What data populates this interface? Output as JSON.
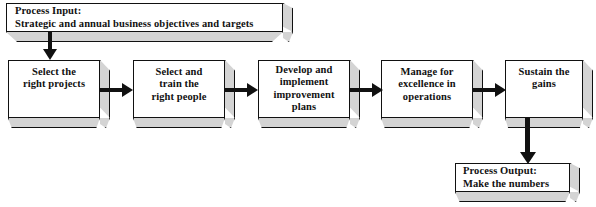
{
  "diagram": {
    "colors": {
      "box_fill": "#ffffff",
      "box_border": "#111111",
      "shadow_face": "#d4d4d4",
      "arrow": "#111111",
      "text": "#111111",
      "background": "#ffffff"
    }
  },
  "input_node": {
    "line1": "Process Input:",
    "line2": "Strategic and annual business objectives and targets"
  },
  "steps": [
    {
      "id": "step-1",
      "line1": "Select the",
      "line2": "right projects",
      "line3": ""
    },
    {
      "id": "step-2",
      "line1": "Select and",
      "line2": "train the",
      "line3": "right people"
    },
    {
      "id": "step-3",
      "line1": "Develop and",
      "line2": "implement",
      "line3": "improvement",
      "line4": "plans"
    },
    {
      "id": "step-4",
      "line1": "Manage for",
      "line2": "excellence in",
      "line3": "operations"
    },
    {
      "id": "step-5",
      "line1": "Sustain the",
      "line2": "gains",
      "line3": ""
    }
  ],
  "output_node": {
    "line1": "Process Output:",
    "line2": "Make the numbers"
  },
  "connectors": [
    {
      "id": "input-to-step-1",
      "type": "vertical-arrow"
    },
    {
      "id": "step-1-to-step-2",
      "type": "horizontal-arrow"
    },
    {
      "id": "step-2-to-step-3",
      "type": "horizontal-arrow"
    },
    {
      "id": "step-3-to-step-4",
      "type": "horizontal-arrow"
    },
    {
      "id": "step-4-to-step-5",
      "type": "horizontal-arrow"
    },
    {
      "id": "step-5-to-output",
      "type": "vertical-arrow"
    }
  ]
}
